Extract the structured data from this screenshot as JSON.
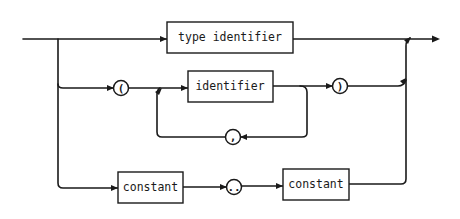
{
  "diagram": {
    "type": "syntax-diagram",
    "nodes": {
      "type_identifier": {
        "kind": "nonterminal",
        "label": "type identifier"
      },
      "open_paren": {
        "kind": "terminal",
        "label": "("
      },
      "identifier": {
        "kind": "nonterminal",
        "label": "identifier"
      },
      "comma": {
        "kind": "terminal",
        "label": ","
      },
      "close_paren": {
        "kind": "terminal",
        "label": ")"
      },
      "constant_low": {
        "kind": "nonterminal",
        "label": "constant"
      },
      "range_dots": {
        "kind": "terminal",
        "label": ".."
      },
      "constant_high": {
        "kind": "nonterminal",
        "label": "constant"
      }
    },
    "paths": [
      [
        "start",
        "type_identifier",
        "end"
      ],
      [
        "start",
        "open_paren",
        "identifier",
        "close_paren",
        "end"
      ],
      [
        "identifier",
        "comma",
        "identifier"
      ],
      [
        "start",
        "constant_low",
        "range_dots",
        "constant_high",
        "end"
      ]
    ],
    "colors": {
      "ink": "#1a1a1a",
      "background": "#ffffff"
    }
  }
}
